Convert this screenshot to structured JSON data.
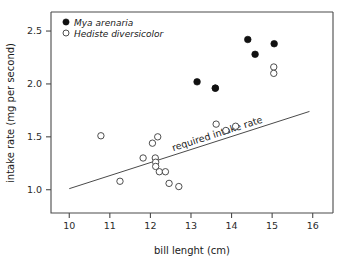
{
  "chart_data": {
    "type": "scatter",
    "title": "",
    "xlabel": "bill lenght (cm)",
    "ylabel": "intake rate (mg per second)",
    "xlim": [
      9.55,
      16.5
    ],
    "ylim": [
      0.78,
      2.68
    ],
    "grid": false,
    "xticks": [
      10,
      11,
      12,
      13,
      14,
      15,
      16
    ],
    "xtick_labels": [
      "10",
      "11",
      "12",
      "13",
      "14",
      "15",
      "16"
    ],
    "yticks": [
      1.0,
      1.5,
      2.0,
      2.5
    ],
    "ytick_labels": [
      "1.0",
      "1.5",
      "2.0",
      "2.5"
    ],
    "legend_position": "top-left",
    "series": [
      {
        "name": "Mya arenaria",
        "marker": "filled-circle",
        "color": "#111111",
        "points": [
          {
            "x": 13.15,
            "y": 2.02
          },
          {
            "x": 13.6,
            "y": 1.96
          },
          {
            "x": 14.4,
            "y": 2.42
          },
          {
            "x": 14.58,
            "y": 2.28
          },
          {
            "x": 15.05,
            "y": 2.38
          }
        ]
      },
      {
        "name": "Hediste diversicolor",
        "marker": "open-circle",
        "color": "#3a3a3a",
        "points": [
          {
            "x": 10.78,
            "y": 1.51
          },
          {
            "x": 11.25,
            "y": 1.08
          },
          {
            "x": 11.82,
            "y": 1.3
          },
          {
            "x": 12.05,
            "y": 1.44
          },
          {
            "x": 12.18,
            "y": 1.5
          },
          {
            "x": 12.12,
            "y": 1.3
          },
          {
            "x": 12.13,
            "y": 1.26
          },
          {
            "x": 12.13,
            "y": 1.22
          },
          {
            "x": 12.22,
            "y": 1.17
          },
          {
            "x": 12.37,
            "y": 1.17
          },
          {
            "x": 12.46,
            "y": 1.06
          },
          {
            "x": 12.7,
            "y": 1.03
          },
          {
            "x": 13.6,
            "y": 1.96
          },
          {
            "x": 13.62,
            "y": 1.62
          },
          {
            "x": 13.86,
            "y": 1.56
          },
          {
            "x": 14.1,
            "y": 1.6
          },
          {
            "x": 15.04,
            "y": 2.16
          },
          {
            "x": 15.04,
            "y": 2.1
          }
        ]
      }
    ],
    "annotation_line": {
      "label": "required intake rate",
      "x_start": 10.0,
      "y_start": 1.01,
      "x_end": 15.92,
      "y_end": 1.74
    }
  },
  "legend": {
    "entries": [
      {
        "label": "Mya arenaria",
        "marker": "filled-circle"
      },
      {
        "label": "Hediste diversicolor",
        "marker": "open-circle"
      }
    ]
  }
}
